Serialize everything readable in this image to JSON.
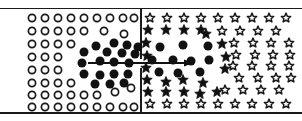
{
  "figure": {
    "title": "Two-panel symbol array with transition arrow",
    "width": 302,
    "height": 121,
    "background": "#ffffff",
    "ink_color": "#1a1a1a",
    "panel_divider_x": 140,
    "top_rule_y": 8,
    "bottom_rule_y": 112
  },
  "arrow": {
    "name": "transition-arrow",
    "x1": 88,
    "y1": 63,
    "x2": 193,
    "y2": 63,
    "direction": "right",
    "color": "#111111",
    "head_length": 9,
    "head_width": 7
  },
  "panels": [
    {
      "id": "left-panel",
      "label": "Open-circle field with filled-circle cluster",
      "base_glyph": "circle-outline",
      "cluster_glyph": "circle-filled",
      "x_range": [
        25,
        139
      ],
      "y_range": [
        9,
        112
      ]
    },
    {
      "id": "right-panel",
      "label": "Open-star field with filled-star and filled-circle cluster",
      "base_glyph": "star-outline",
      "cluster_glyph": "star-filled",
      "core_glyph": "circle-filled",
      "x_range": [
        143,
        292
      ],
      "y_range": [
        9,
        112
      ]
    }
  ],
  "legend": {
    "circle_outline": "open circle",
    "circle_filled": "filled circle",
    "star_outline": "open star",
    "star_filled": "filled star"
  },
  "chart_data": {
    "type": "scatter",
    "title": "Two-panel symbol array with transition arrow",
    "xlabel": "",
    "ylabel": "",
    "xlim": [
      0,
      302
    ],
    "ylim": [
      0,
      121
    ],
    "grid": false,
    "legend_position": "none",
    "series": [
      {
        "name": "left-open-circles",
        "marker": "circle-outline",
        "size": 9,
        "color": "#1a1a1a",
        "points": [
          [
            32,
            18
          ],
          [
            45,
            18
          ],
          [
            58,
            18
          ],
          [
            71,
            18
          ],
          [
            84,
            18
          ],
          [
            97,
            18
          ],
          [
            110,
            18
          ],
          [
            123,
            18
          ],
          [
            134,
            18
          ],
          [
            32,
            31
          ],
          [
            45,
            31
          ],
          [
            58,
            31
          ],
          [
            71,
            31
          ],
          [
            84,
            31
          ],
          [
            104,
            31
          ],
          [
            124,
            34
          ],
          [
            32,
            44
          ],
          [
            45,
            44
          ],
          [
            58,
            44
          ],
          [
            71,
            44
          ],
          [
            32,
            57
          ],
          [
            45,
            57
          ],
          [
            58,
            57
          ],
          [
            32,
            70
          ],
          [
            45,
            70
          ],
          [
            58,
            70
          ],
          [
            32,
            83
          ],
          [
            45,
            83
          ],
          [
            58,
            83
          ],
          [
            71,
            83
          ],
          [
            32,
            95
          ],
          [
            45,
            95
          ],
          [
            58,
            95
          ],
          [
            71,
            95
          ],
          [
            84,
            95
          ],
          [
            97,
            95
          ],
          [
            115,
            92
          ],
          [
            131,
            88
          ],
          [
            32,
            107
          ],
          [
            45,
            107
          ],
          [
            58,
            107
          ],
          [
            71,
            107
          ],
          [
            84,
            107
          ],
          [
            97,
            107
          ],
          [
            110,
            107
          ],
          [
            123,
            107
          ],
          [
            134,
            107
          ]
        ]
      },
      {
        "name": "left-filled-circles",
        "marker": "circle-filled",
        "size": 9,
        "color": "#111111",
        "points": [
          [
            96,
            46
          ],
          [
            114,
            43
          ],
          [
            127,
            45
          ],
          [
            138,
            47
          ],
          [
            84,
            52
          ],
          [
            107,
            52
          ],
          [
            122,
            53
          ],
          [
            135,
            54
          ],
          [
            82,
            63
          ],
          [
            100,
            61
          ],
          [
            114,
            62
          ],
          [
            129,
            63
          ],
          [
            84,
            74
          ],
          [
            100,
            75
          ],
          [
            114,
            74
          ],
          [
            128,
            74
          ],
          [
            95,
            84
          ],
          [
            110,
            84
          ],
          [
            124,
            83
          ]
        ]
      },
      {
        "name": "right-open-stars",
        "marker": "star-outline",
        "size": 11,
        "color": "#1a1a1a",
        "points": [
          [
            150,
            18
          ],
          [
            167,
            18
          ],
          [
            184,
            18
          ],
          [
            201,
            18
          ],
          [
            218,
            18
          ],
          [
            235,
            18
          ],
          [
            252,
            18
          ],
          [
            269,
            18
          ],
          [
            286,
            18
          ],
          [
            222,
            31
          ],
          [
            240,
            31
          ],
          [
            258,
            31
          ],
          [
            276,
            31
          ],
          [
            234,
            43
          ],
          [
            253,
            43
          ],
          [
            271,
            43
          ],
          [
            289,
            43
          ],
          [
            236,
            55
          ],
          [
            255,
            55
          ],
          [
            273,
            55
          ],
          [
            290,
            55
          ],
          [
            233,
            66
          ],
          [
            252,
            66
          ],
          [
            271,
            66
          ],
          [
            289,
            66
          ],
          [
            239,
            78
          ],
          [
            258,
            78
          ],
          [
            276,
            78
          ],
          [
            291,
            78
          ],
          [
            225,
            90
          ],
          [
            243,
            90
          ],
          [
            261,
            90
          ],
          [
            279,
            90
          ],
          [
            150,
            104
          ],
          [
            167,
            104
          ],
          [
            184,
            104
          ],
          [
            201,
            104
          ],
          [
            218,
            104
          ],
          [
            235,
            104
          ],
          [
            252,
            104
          ],
          [
            269,
            104
          ],
          [
            286,
            104
          ]
        ]
      },
      {
        "name": "right-filled-stars",
        "marker": "star-filled",
        "size": 11,
        "color": "#111111",
        "points": [
          [
            148,
            30
          ],
          [
            166,
            30
          ],
          [
            184,
            30
          ],
          [
            201,
            30
          ],
          [
            146,
            43
          ],
          [
            206,
            34
          ],
          [
            222,
            44
          ],
          [
            147,
            56
          ],
          [
            226,
            57
          ],
          [
            146,
            68
          ],
          [
            225,
            69
          ],
          [
            147,
            80
          ],
          [
            166,
            82
          ],
          [
            183,
            80
          ],
          [
            203,
            83
          ],
          [
            148,
            92
          ],
          [
            166,
            92
          ],
          [
            184,
            92
          ],
          [
            200,
            94
          ],
          [
            217,
            92
          ]
        ]
      },
      {
        "name": "right-filled-circles",
        "marker": "circle-filled",
        "size": 9,
        "color": "#111111",
        "points": [
          [
            160,
            47
          ],
          [
            183,
            45
          ],
          [
            208,
            46
          ],
          [
            152,
            60
          ],
          [
            173,
            60
          ],
          [
            191,
            61
          ],
          [
            209,
            60
          ],
          [
            159,
            72
          ],
          [
            178,
            73
          ],
          [
            200,
            72
          ]
        ]
      }
    ]
  }
}
